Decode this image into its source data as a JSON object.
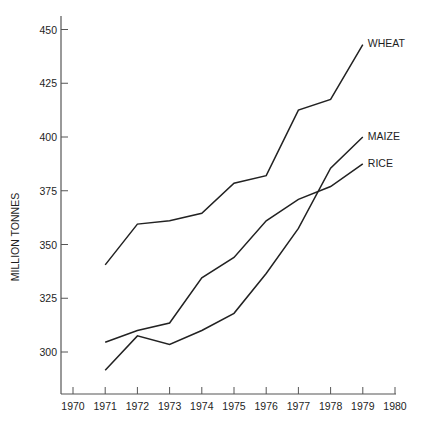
{
  "chart_data": {
    "type": "line",
    "title": "",
    "xlabel": "",
    "ylabel": "MILLION TONNES",
    "x": [
      1971,
      1972,
      1973,
      1974,
      1975,
      1976,
      1977,
      1978,
      1979
    ],
    "x_ticks": [
      "1970",
      "1971",
      "1972",
      "1973",
      "1974",
      "1975",
      "1976",
      "1977",
      "1978",
      "1979",
      "1980"
    ],
    "y_ticks": [
      "300",
      "325",
      "350",
      "375",
      "400",
      "425",
      "450"
    ],
    "xlim": [
      1970,
      1980
    ],
    "ylim": [
      281,
      456
    ],
    "grid": false,
    "legend": "inline labels at line ends",
    "series": [
      {
        "name": "WHEAT",
        "values": [
          340.5,
          359.5,
          361,
          364.5,
          378.5,
          382,
          412.5,
          417.5,
          443
        ]
      },
      {
        "name": "MAIZE",
        "values": [
          291.5,
          307.5,
          303.5,
          310,
          318,
          336.5,
          357.5,
          385.5,
          400
        ]
      },
      {
        "name": "RICE",
        "values": [
          304.5,
          310,
          313.5,
          334.5,
          344,
          361,
          371,
          377,
          387.5
        ]
      }
    ]
  }
}
